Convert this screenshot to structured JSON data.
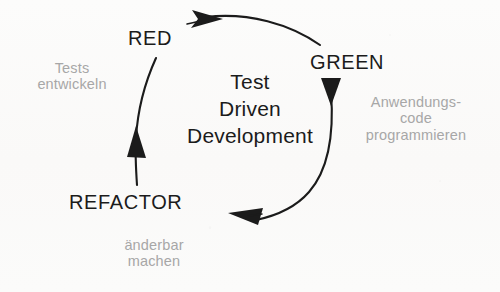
{
  "diagram": {
    "title_lines": [
      "Test",
      "Driven",
      "Development"
    ],
    "background_color": "#fbfbfa",
    "stage_color": "#1b1b1b",
    "note_color": "#a7a7a7",
    "arrow_color": "#1b1b1b",
    "stages": [
      {
        "id": "red",
        "label": "RED"
      },
      {
        "id": "green",
        "label": "GREEN"
      },
      {
        "id": "refactor",
        "label": "REFACTOR"
      }
    ],
    "notes": [
      {
        "id": "tests-entwickeln",
        "lines": [
          "Tests",
          "entwickeln"
        ]
      },
      {
        "id": "anwendungscode",
        "lines": [
          "Anwendungs-",
          "code",
          "programmieren"
        ]
      },
      {
        "id": "aenderbar-machen",
        "lines": [
          "änderbar",
          "machen"
        ]
      }
    ],
    "arrows": [
      {
        "id": "red-to-green",
        "from": "RED",
        "to": "GREEN",
        "direction": "clockwise-top"
      },
      {
        "id": "green-to-refactor",
        "from": "GREEN",
        "to": "REFACTOR",
        "direction": "clockwise-right-bottom"
      },
      {
        "id": "refactor-to-red",
        "from": "REFACTOR",
        "to": "RED",
        "direction": "clockwise-left"
      }
    ]
  }
}
